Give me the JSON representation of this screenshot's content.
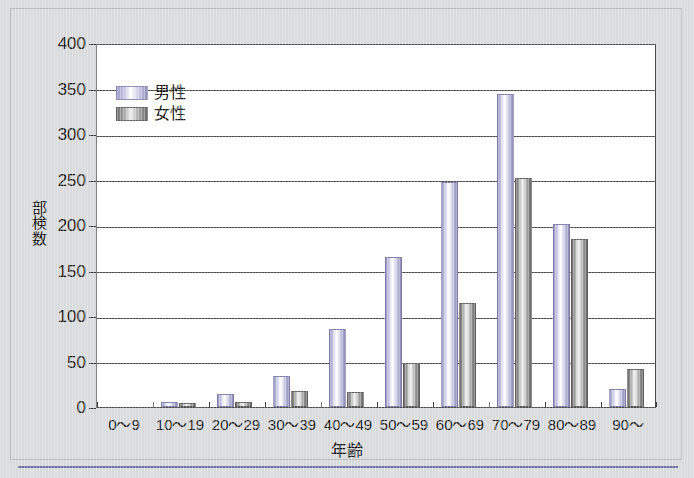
{
  "figure": {
    "background_color": "#d9dadb",
    "plot_background_color": "#ffffff",
    "rule_color": "#6f6fa8"
  },
  "chart_data": {
    "type": "bar",
    "title": "",
    "subtitle": "",
    "xlabel": "年齢",
    "ylabel": "剖検数",
    "ylabel_chars": [
      "部",
      "検",
      "数"
    ],
    "categories": [
      "0～9",
      "10～19",
      "20～29",
      "30～39",
      "40～49",
      "50～59",
      "60～69",
      "70～79",
      "80～89",
      "90～"
    ],
    "series": [
      {
        "name": "男性",
        "color": "#b5b5d8",
        "values": [
          0,
          3,
          12,
          32,
          83,
          163,
          245,
          342,
          199,
          18
        ]
      },
      {
        "name": "女性",
        "color": "#8e8e8e",
        "values": [
          0,
          2,
          3,
          15,
          14,
          46,
          112,
          249,
          182,
          40
        ]
      }
    ],
    "ylim": [
      0,
      400
    ],
    "yticks": [
      0,
      50,
      100,
      150,
      200,
      250,
      300,
      350,
      400
    ],
    "ytick_labels": [
      "0",
      "50",
      "100",
      "150",
      "200",
      "250",
      "300",
      "350",
      "400"
    ],
    "grid": true,
    "grid_axis": "y",
    "legend_position": "upper left",
    "legend_entries": [
      "男性",
      "女性"
    ]
  }
}
